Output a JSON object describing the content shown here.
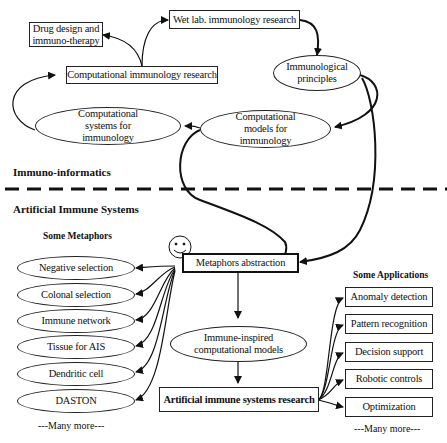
{
  "immuno_informatics": {
    "section_label": "Immuno-informatics",
    "nodes": {
      "wet_lab": "Wet lab. immunology research",
      "drug_design": "Drug design and immuno-therapy",
      "comp_immunology_research": "Computational immunology research",
      "immunological_principles": "Immunological principles",
      "comp_systems": "Computational systems for immunology",
      "comp_models": "Computational models for immunology"
    }
  },
  "ais": {
    "section_label": "Artificial Immune Systems",
    "metaphors_heading": "Some Metaphors",
    "metaphors": [
      "Negative selection",
      "Colonal selection",
      "Immune network",
      "Tissue for AIS",
      "Dendritic cell",
      "DASTON"
    ],
    "metaphors_more": "---Many more---",
    "metaphors_abstraction": "Metaphors abstraction",
    "immune_inspired_models": "Immune-inspired computational models",
    "ais_research": "Artificial immune systems research",
    "applications_heading": "Some Applications",
    "applications": [
      "Anomaly detection",
      "Pattern recognition",
      "Decision support",
      "Robotic controls",
      "Optimization"
    ],
    "applications_more": "---Many more---"
  }
}
